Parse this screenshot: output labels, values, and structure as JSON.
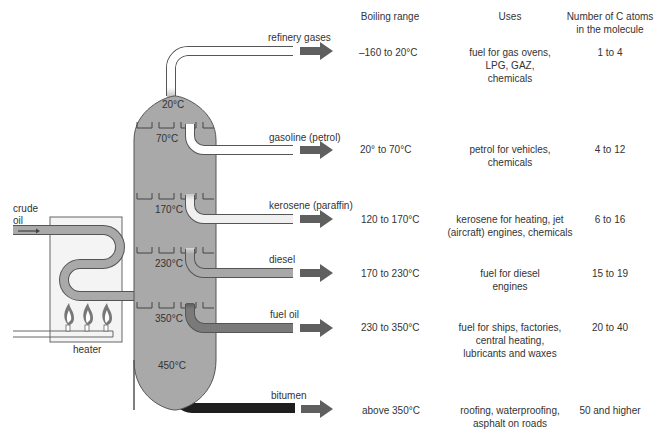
{
  "headers": {
    "boiling_range": "Boiling range",
    "uses": "Uses",
    "carbon_atoms_line1": "Number of C atoms",
    "carbon_atoms_line2": "in the molecule"
  },
  "feed": {
    "crude_line1": "crude",
    "crude_line2": "oil",
    "heater": "heater"
  },
  "column_temperatures": [
    "20°C",
    "70°C",
    "170°C",
    "230°C",
    "350°C",
    "450°C"
  ],
  "fractions": [
    {
      "name": "refinery gases",
      "boiling_range": "–160 to 20°C",
      "uses": [
        "fuel for gas ovens,",
        "LPG, GAZ,",
        "chemicals"
      ],
      "carbon_atoms": "1 to 4",
      "pipe_color": "#ffffff"
    },
    {
      "name": "gasoline (petrol)",
      "boiling_range": "20° to 70°C",
      "uses": [
        "petrol for vehicles,",
        "chemicals"
      ],
      "carbon_atoms": "4 to 12",
      "pipe_color": "#ffffff"
    },
    {
      "name": "kerosene (paraffin)",
      "boiling_range": "120 to 170°C",
      "uses": [
        "kerosene for heating, jet",
        "(aircraft) engines, chemicals"
      ],
      "carbon_atoms": "6 to 16",
      "pipe_color": "#eeeeee"
    },
    {
      "name": "diesel",
      "boiling_range": "170 to 230°C",
      "uses": [
        "fuel for diesel",
        "engines"
      ],
      "carbon_atoms": "15 to 19",
      "pipe_color": "#a8a8a8"
    },
    {
      "name": "fuel oil",
      "boiling_range": "230 to 350°C",
      "uses": [
        "fuel for ships, factories,",
        "central heating,",
        "lubricants and waxes"
      ],
      "carbon_atoms": "20 to 40",
      "pipe_color": "#7a7a7a"
    },
    {
      "name": "bitumen",
      "boiling_range": "above 350°C",
      "uses": [
        "roofing, waterproofing,",
        "asphalt on roads"
      ],
      "carbon_atoms": "50 and higher",
      "pipe_color": "#1e1e1e"
    }
  ],
  "colors": {
    "column_fill": "#a9a9a9",
    "arrow": "#5f5f5f",
    "outline": "#555555"
  }
}
